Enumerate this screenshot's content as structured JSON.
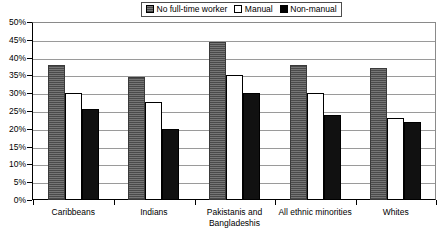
{
  "legend": {
    "position": "top-center",
    "items": [
      {
        "label": "No full-time worker",
        "swatch": "hatched-gray-swatch",
        "color": "#5f5f5f"
      },
      {
        "label": "Manual",
        "swatch": "white-swatch",
        "color": "#ffffff"
      },
      {
        "label": "Non-manual",
        "swatch": "black-swatch",
        "color": "#000000"
      }
    ]
  },
  "axis": {
    "y_ticks": [
      "50%",
      "45%",
      "40%",
      "35%",
      "30%",
      "25%",
      "20%",
      "15%",
      "10%",
      "5%",
      "0%"
    ]
  },
  "chart_data": {
    "type": "bar",
    "title": "",
    "xlabel": "",
    "ylabel": "",
    "ylim": [
      0,
      50
    ],
    "ytick_step": 5,
    "ytick_suffix": "%",
    "grid": true,
    "legend_position": "top-center",
    "categories": [
      "Caribbeans",
      "Indians",
      "Pakistanis and Bangladeshis",
      "All ethnic minorities",
      "Whites"
    ],
    "series": [
      {
        "name": "No full-time worker",
        "color": "#5f5f5f",
        "values": [
          38,
          34.5,
          44.5,
          38,
          37
        ]
      },
      {
        "name": "Manual",
        "color": "#ffffff",
        "values": [
          30,
          27.5,
          35,
          30,
          23
        ]
      },
      {
        "name": "Non-manual",
        "color": "#000000",
        "values": [
          25.5,
          20,
          30,
          24,
          22
        ]
      }
    ]
  }
}
